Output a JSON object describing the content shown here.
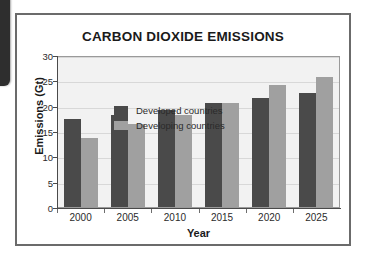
{
  "left_edge_element": {
    "name": "clipped-dark-panel"
  },
  "chart_data": {
    "type": "bar",
    "title": "CARBON DIOXIDE EMISSIONS",
    "xlabel": "Year",
    "ylabel": "Emissions (Gt)",
    "categories": [
      "2000",
      "2005",
      "2010",
      "2015",
      "2020",
      "2025"
    ],
    "series": [
      {
        "name": "Developed countries",
        "color": "#4a4a4a",
        "values": [
          17.4,
          18.2,
          19.2,
          20.6,
          21.5,
          22.6
        ]
      },
      {
        "name": "Developing countries",
        "color": "#a0a0a0",
        "values": [
          13.6,
          16.3,
          18.2,
          20.6,
          24.0,
          25.6
        ]
      }
    ],
    "ylim": [
      0,
      30
    ],
    "yticks": [
      "0",
      "5",
      "10",
      "15",
      "20",
      "25",
      "30"
    ],
    "grid": true,
    "legend_position": "top-left-inside",
    "plot_background": "#f2f2f2"
  }
}
